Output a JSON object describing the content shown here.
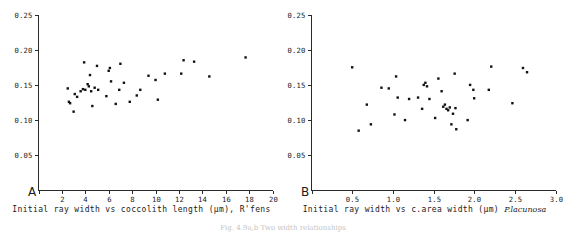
{
  "figure": {
    "caption": "Fig. 4.9a,b  Two width relationships"
  },
  "panels": [
    {
      "letter": "A",
      "caption_main": "Initial ray width vs coccolith length (µm), R'fens",
      "caption_species": "",
      "chart_data": {
        "type": "scatter",
        "title": "",
        "xlabel": "Initial ray width vs coccolith length (µm), R'fens",
        "ylabel": "",
        "xlim": [
          0,
          20
        ],
        "ylim": [
          0,
          0.25
        ],
        "xticks": [
          0,
          2,
          4,
          6,
          8,
          10,
          12,
          14,
          16,
          18,
          20
        ],
        "xtick_labels": [
          "",
          "2",
          "4",
          "6",
          "8",
          "10",
          "12",
          "14",
          "16",
          "18",
          "20"
        ],
        "yticks": [
          0.05,
          0.1,
          0.15,
          0.2,
          0.25
        ],
        "ytick_labels": [
          "0.05",
          "0.10",
          "0.15",
          "0.20",
          "0.25"
        ],
        "grid": false,
        "legend": "none",
        "points": [
          [
            2.5,
            0.145
          ],
          [
            2.6,
            0.126
          ],
          [
            2.7,
            0.124
          ],
          [
            3.0,
            0.112
          ],
          [
            3.1,
            0.137
          ],
          [
            3.3,
            0.133
          ],
          [
            3.6,
            0.141
          ],
          [
            3.8,
            0.144
          ],
          [
            3.9,
            0.182
          ],
          [
            4.0,
            0.143
          ],
          [
            4.2,
            0.151
          ],
          [
            4.3,
            0.148
          ],
          [
            4.4,
            0.164
          ],
          [
            4.5,
            0.141
          ],
          [
            4.6,
            0.12
          ],
          [
            4.8,
            0.146
          ],
          [
            5.0,
            0.177
          ],
          [
            5.1,
            0.143
          ],
          [
            5.8,
            0.134
          ],
          [
            6.0,
            0.17
          ],
          [
            6.1,
            0.174
          ],
          [
            6.2,
            0.155
          ],
          [
            6.6,
            0.123
          ],
          [
            6.9,
            0.143
          ],
          [
            7.0,
            0.18
          ],
          [
            7.3,
            0.153
          ],
          [
            7.8,
            0.126
          ],
          [
            8.4,
            0.135
          ],
          [
            8.7,
            0.143
          ],
          [
            9.4,
            0.163
          ],
          [
            10.0,
            0.157
          ],
          [
            10.2,
            0.129
          ],
          [
            10.8,
            0.166
          ],
          [
            12.2,
            0.166
          ],
          [
            12.4,
            0.185
          ],
          [
            13.3,
            0.183
          ],
          [
            14.6,
            0.162
          ],
          [
            17.7,
            0.189
          ]
        ]
      }
    },
    {
      "letter": "B",
      "caption_main": "Initial ray width vs c.area width (µm) ",
      "caption_species": "P.lacunosa",
      "chart_data": {
        "type": "scatter",
        "title": "",
        "xlabel": "Initial ray width vs c.area width (µm) P.lacunosa",
        "ylabel": "",
        "xlim": [
          0,
          3.0
        ],
        "ylim": [
          0,
          0.25
        ],
        "xticks": [
          0,
          0.5,
          1.0,
          1.5,
          2.0,
          2.5,
          3.0
        ],
        "xtick_labels": [
          "",
          "0.5",
          "1.0",
          "1.5",
          "2.0",
          "2.5",
          "3.0"
        ],
        "yticks": [
          0.05,
          0.1,
          0.15,
          0.2,
          0.25
        ],
        "ytick_labels": [
          "0.05",
          "0.10",
          "0.15",
          "0.20",
          "0.25"
        ],
        "grid": false,
        "legend": "none",
        "points": [
          [
            0.5,
            0.175
          ],
          [
            0.58,
            0.085
          ],
          [
            0.68,
            0.122
          ],
          [
            0.73,
            0.094
          ],
          [
            0.86,
            0.146
          ],
          [
            0.95,
            0.145
          ],
          [
            1.02,
            0.108
          ],
          [
            1.04,
            0.162
          ],
          [
            1.06,
            0.132
          ],
          [
            1.15,
            0.1
          ],
          [
            1.2,
            0.13
          ],
          [
            1.31,
            0.132
          ],
          [
            1.36,
            0.116
          ],
          [
            1.38,
            0.15
          ],
          [
            1.4,
            0.153
          ],
          [
            1.42,
            0.148
          ],
          [
            1.45,
            0.13
          ],
          [
            1.52,
            0.103
          ],
          [
            1.56,
            0.159
          ],
          [
            1.6,
            0.141
          ],
          [
            1.62,
            0.119
          ],
          [
            1.64,
            0.122
          ],
          [
            1.66,
            0.116
          ],
          [
            1.68,
            0.114
          ],
          [
            1.7,
            0.118
          ],
          [
            1.72,
            0.094
          ],
          [
            1.74,
            0.109
          ],
          [
            1.76,
            0.166
          ],
          [
            1.77,
            0.117
          ],
          [
            1.78,
            0.087
          ],
          [
            1.92,
            0.1
          ],
          [
            1.95,
            0.15
          ],
          [
            1.99,
            0.143
          ],
          [
            2.0,
            0.131
          ],
          [
            2.18,
            0.143
          ],
          [
            2.21,
            0.176
          ],
          [
            2.47,
            0.124
          ],
          [
            2.6,
            0.174
          ],
          [
            2.65,
            0.168
          ]
        ]
      }
    }
  ]
}
